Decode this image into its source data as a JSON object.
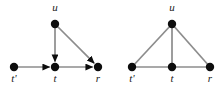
{
  "figure": {
    "background_color": "#ffffff",
    "width": 222,
    "height": 90,
    "node_color": "#0d0d0d",
    "edge_color": "#8c8c8c",
    "label_color": "#1a1a1a",
    "node_radius": 4.2,
    "edge_width": 1.7
  },
  "diagrams": [
    {
      "id": "left-digraph",
      "name": "directed-graph",
      "directed": true,
      "nodes": [
        {
          "id": "u",
          "label": "u",
          "x": 55,
          "y": 24,
          "label_x": 55,
          "label_y": 2
        },
        {
          "id": "tp",
          "label": "t'",
          "x": 14,
          "y": 67,
          "label_x": 14,
          "label_y": 73
        },
        {
          "id": "t",
          "label": "t",
          "x": 55,
          "y": 67,
          "label_x": 55,
          "label_y": 73
        },
        {
          "id": "r",
          "label": "r",
          "x": 98,
          "y": 67,
          "label_x": 98,
          "label_y": 73
        }
      ],
      "edges": [
        {
          "from": "u",
          "to": "t",
          "arrow": true
        },
        {
          "from": "u",
          "to": "r",
          "arrow": true
        },
        {
          "from": "tp",
          "to": "t",
          "arrow": true
        },
        {
          "from": "t",
          "to": "r",
          "arrow": true
        }
      ]
    },
    {
      "id": "right-graph",
      "name": "undirected-graph",
      "directed": false,
      "nodes": [
        {
          "id": "u",
          "label": "u",
          "x": 172,
          "y": 24,
          "label_x": 172,
          "label_y": 2
        },
        {
          "id": "tp",
          "label": "t'",
          "x": 132,
          "y": 67,
          "label_x": 132,
          "label_y": 73
        },
        {
          "id": "t",
          "label": "t",
          "x": 172,
          "y": 67,
          "label_x": 172,
          "label_y": 73
        },
        {
          "id": "r",
          "label": "r",
          "x": 210,
          "y": 67,
          "label_x": 210,
          "label_y": 73
        }
      ],
      "edges": [
        {
          "from": "u",
          "to": "t",
          "arrow": false
        },
        {
          "from": "u",
          "to": "tp",
          "arrow": false
        },
        {
          "from": "u",
          "to": "r",
          "arrow": false
        },
        {
          "from": "tp",
          "to": "t",
          "arrow": false
        },
        {
          "from": "t",
          "to": "r",
          "arrow": false
        }
      ]
    }
  ]
}
